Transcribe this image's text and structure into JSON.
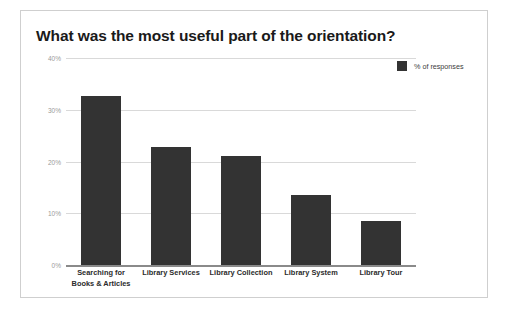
{
  "chart_data": {
    "type": "bar",
    "title": "What was the most useful part of the orientation?",
    "categories": [
      "Searching for Books & Articles",
      "Library Services",
      "Library Collection",
      "Library System",
      "Library Tour"
    ],
    "values": [
      32.7,
      22.8,
      21.0,
      13.5,
      8.5
    ],
    "series": [
      {
        "name": "% of responses",
        "values": [
          32.7,
          22.8,
          21.0,
          13.5,
          8.5
        ]
      }
    ],
    "xlabel": "",
    "ylabel": "",
    "ylim": [
      0,
      40
    ],
    "yticks": [
      0,
      10,
      20,
      30,
      40
    ],
    "ytick_labels": [
      "0%",
      "10%",
      "20%",
      "30%",
      "40%"
    ],
    "grid": true,
    "legend": {
      "position": "top-right",
      "entries": [
        {
          "label": "% of responses",
          "color": "#333333"
        }
      ]
    },
    "colors": {
      "bar": "#333333",
      "gridline": "#d9d9d9",
      "baseline": "#8a8a8a",
      "title": "#1a1a1a",
      "tick_label": "#9a9a9a",
      "category_label": "#2b2b2b",
      "card_border": "#cfcfcf",
      "background": "#ffffff"
    }
  }
}
